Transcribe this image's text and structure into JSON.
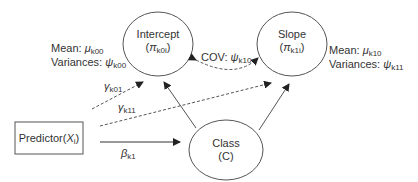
{
  "nodes": {
    "intercept": {
      "title": "Intercept",
      "sym": "π",
      "sub": "k0i"
    },
    "slope": {
      "title": "Slope",
      "sym": "π",
      "sub": "k1i"
    },
    "class": {
      "title": "Class",
      "sub_label": "(C)"
    },
    "predictor": {
      "title": "Predictor(",
      "sym": "X",
      "sub": "i",
      "close": ")"
    }
  },
  "annotations": {
    "intercept_mean_label": "Mean: ",
    "intercept_mean_sym": "μ",
    "intercept_mean_sub": "k00",
    "intercept_var_label": "Variances: ",
    "intercept_var_sym": "ψ",
    "intercept_var_sub": "k00",
    "slope_mean_label": "Mean: ",
    "slope_mean_sym": "μ",
    "slope_mean_sub": "k10",
    "slope_var_label": "Variances: ",
    "slope_var_sym": "ψ",
    "slope_var_sub": "k11",
    "cov_label": "COV: ",
    "cov_sym": "ψ",
    "cov_sub": "k10"
  },
  "edges": {
    "gamma01": {
      "sym": "γ",
      "sub": "k01"
    },
    "gamma11": {
      "sym": "γ",
      "sub": "k11"
    },
    "beta": {
      "sym": "β",
      "sub": "k1"
    }
  },
  "colors": {
    "stroke": "#555555",
    "text": "#333333"
  }
}
